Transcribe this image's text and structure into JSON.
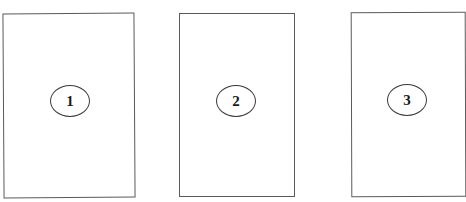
{
  "diagram": {
    "panels": [
      {
        "label": "1"
      },
      {
        "label": "2"
      },
      {
        "label": "3"
      }
    ],
    "colors": {
      "border": "#5a5a5a",
      "oval_border": "#3a3a3a",
      "text": "#1a1a1a",
      "background": "#ffffff"
    }
  }
}
